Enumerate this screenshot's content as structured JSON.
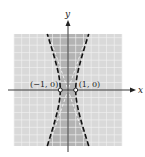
{
  "chart_data": {
    "type": "line",
    "title": "",
    "xlabel": "x",
    "ylabel": "y",
    "xlim": [
      -7,
      7
    ],
    "ylim": [
      -7.5,
      7.5
    ],
    "grid": true,
    "curve": {
      "name": "hyperbola boundary",
      "equation": "x^2 - y^2/9 = 1",
      "style": "dashed",
      "b": 3
    },
    "asymptotes": {
      "name": "asymptotes",
      "slopes": [
        3,
        -3
      ],
      "style": "dashed-light"
    },
    "shaded_region": "x^2 - y^2/9 < 1",
    "points": [
      {
        "x": -1,
        "y": 0,
        "label": "(−1, 0)",
        "open": true
      },
      {
        "x": 1,
        "y": 0,
        "label": "(1, 0)",
        "open": true
      }
    ]
  },
  "colors": {
    "background_region": "#d9d9d9",
    "shaded_region": "#b3b3b3",
    "grid": "#f2f2f2",
    "axis": "#222222",
    "curve": "#111111"
  }
}
